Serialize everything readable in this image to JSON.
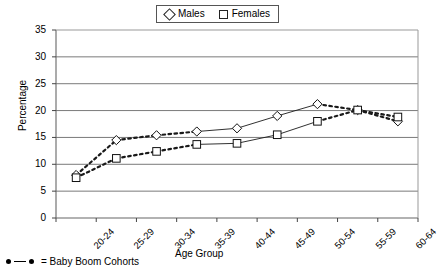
{
  "chart_data": {
    "type": "line",
    "title": "",
    "xlabel": "Age Group",
    "ylabel": "Percentage",
    "categories": [
      "20-24",
      "25-29",
      "30-34",
      "35-39",
      "40-44",
      "45-49",
      "50-54",
      "55-59",
      "60-64"
    ],
    "ylim": [
      0,
      35
    ],
    "yticks": [
      0,
      5,
      10,
      15,
      20,
      25,
      30,
      35
    ],
    "grid": true,
    "legend_position": "top-center",
    "series": [
      {
        "name": "Males",
        "marker": "diamond",
        "values": [
          8.0,
          14.5,
          15.4,
          16.1,
          16.7,
          19.0,
          21.2,
          20.1,
          18.0
        ]
      },
      {
        "name": "Females",
        "marker": "square",
        "values": [
          7.5,
          11.1,
          12.4,
          13.7,
          13.9,
          15.5,
          18.0,
          20.1,
          18.8
        ]
      }
    ],
    "annotations": {
      "footnote": "= Baby Boom Cohorts",
      "footnote_marker": "dot-line-dot",
      "dashed_meaning": "Baby Boom Cohorts shown with dashed connectors"
    }
  },
  "legend": {
    "items": [
      {
        "label": "Males",
        "icon": "diamond-marker"
      },
      {
        "label": "Females",
        "icon": "square-marker"
      }
    ]
  },
  "footnote": {
    "text": "= Baby Boom Cohorts"
  }
}
